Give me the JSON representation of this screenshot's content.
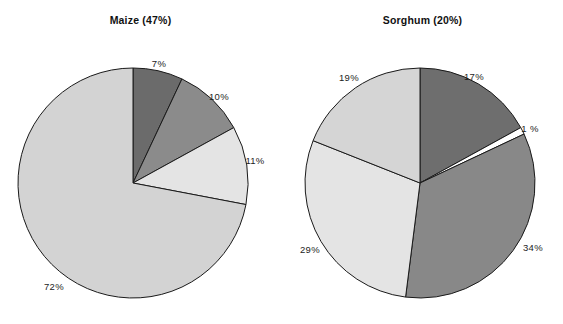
{
  "figure": {
    "width": 563,
    "height": 324,
    "background": "#ffffff"
  },
  "chart_data": [
    {
      "type": "pie",
      "title": "Maize (47%)",
      "crop": "Maize",
      "crop_share": "47%",
      "center": [
        133,
        183
      ],
      "radius": 115,
      "start_angle_deg": 0,
      "direction": "clockwise",
      "legend": "none",
      "grid": false,
      "labels": [
        "7%",
        "10%",
        "11%",
        "72%"
      ],
      "values": [
        7,
        10,
        11,
        72
      ],
      "colors": [
        "#6b6b6b",
        "#8b8b8b",
        "#e4e4e4",
        "#d3d3d3"
      ],
      "edge_color": "#1a1a1a",
      "slices": [
        {
          "label": "7%",
          "value": 7,
          "color": "#6b6b6b",
          "label_x": 159,
          "label_y": 63
        },
        {
          "label": "10%",
          "value": 10,
          "color": "#8b8b8b",
          "label_x": 219,
          "label_y": 96
        },
        {
          "label": "11%",
          "value": 11,
          "color": "#e4e4e4",
          "label_x": 255,
          "label_y": 160
        },
        {
          "label": "72%",
          "value": 72,
          "color": "#d3d3d3",
          "label_x": 54,
          "label_y": 286
        }
      ]
    },
    {
      "type": "pie",
      "title": "Sorghum (20%)",
      "crop": "Sorghum",
      "crop_share": "20%",
      "center": [
        420,
        183
      ],
      "radius": 115,
      "start_angle_deg": 0,
      "direction": "clockwise",
      "legend": "none",
      "grid": false,
      "labels": [
        "17%",
        "1 %",
        "34%",
        "29%",
        "19%"
      ],
      "values": [
        17,
        1,
        34,
        29,
        19
      ],
      "colors": [
        "#6e6e6e",
        "#ffffff",
        "#888888",
        "#e4e4e4",
        "#d5d5d5"
      ],
      "edge_color": "#1a1a1a",
      "slices": [
        {
          "label": "17%",
          "value": 17,
          "color": "#6e6e6e",
          "label_x": 474,
          "label_y": 76
        },
        {
          "label": "1 %",
          "value": 1,
          "color": "#ffffff",
          "label_x": 530,
          "label_y": 128
        },
        {
          "label": "34%",
          "value": 34,
          "color": "#888888",
          "label_x": 533,
          "label_y": 247
        },
        {
          "label": "29%",
          "value": 29,
          "color": "#e4e4e4",
          "label_x": 310,
          "label_y": 249
        },
        {
          "label": "19%",
          "value": 19,
          "color": "#d5d5d5",
          "label_x": 349,
          "label_y": 77
        }
      ]
    }
  ]
}
